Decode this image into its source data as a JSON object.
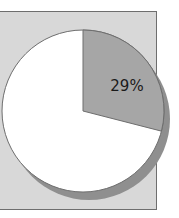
{
  "chart_data": {
    "type": "pie",
    "title": "",
    "slices": [
      {
        "label": "29%",
        "value": 29,
        "color": "#a6a6a6",
        "show_label": true
      },
      {
        "label": "71%",
        "value": 71,
        "color": "#ffffff",
        "show_label": false
      }
    ],
    "start_angle_deg": 0,
    "direction": "clockwise",
    "shadow": true,
    "plot_background": "#d8d8d8",
    "legend": "none"
  },
  "labels": {
    "highlight_slice": "29%"
  },
  "colors": {
    "highlight": "#a6a6a6",
    "remainder": "#ffffff",
    "shadow": "#8f8f8f",
    "outline": "#6e6e6e",
    "plot_area": "#d8d8d8"
  }
}
